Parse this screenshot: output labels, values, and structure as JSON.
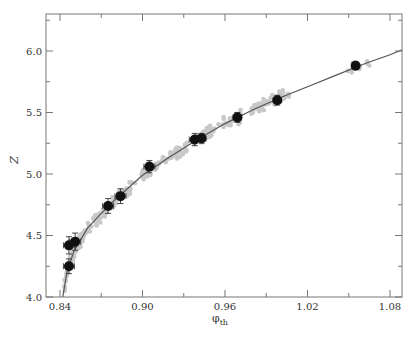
{
  "chart_data": {
    "type": "scatter",
    "title": "",
    "xlabel": "φ",
    "xlabel_sub": "th",
    "ylabel": "Z",
    "xlim": [
      0.83,
      1.09
    ],
    "ylim": [
      4.0,
      6.3
    ],
    "grid": false,
    "legend": null,
    "x_ticks": [
      0.84,
      0.9,
      0.96,
      1.02,
      1.08
    ],
    "x_tick_labels": [
      "0.84",
      "0.90",
      "0.96",
      "1.02",
      "1.08"
    ],
    "x_minor_ticks": [
      0.87,
      0.93,
      0.99,
      1.05
    ],
    "y_ticks": [
      4.0,
      4.5,
      5.0,
      5.5,
      6.0
    ],
    "y_tick_labels": [
      "4.0",
      "4.5",
      "5.0",
      "5.5",
      "6.0"
    ],
    "y_minor_ticks": [
      4.25,
      4.75,
      5.25,
      5.75,
      6.25
    ],
    "series": [
      {
        "name": "mean points with error bars",
        "style": "black filled circles",
        "color": "#111111",
        "x": [
          0.8465,
          0.8465,
          0.851,
          0.875,
          0.884,
          0.905,
          0.938,
          0.943,
          0.969,
          0.998,
          1.055
        ],
        "y": [
          4.25,
          4.42,
          4.45,
          4.74,
          4.82,
          5.06,
          5.28,
          5.29,
          5.46,
          5.6,
          5.88
        ],
        "xerr": [
          0.004,
          0.004,
          0.004,
          0.004,
          0.004,
          0.004,
          0.004,
          0.003,
          0.003,
          0.003,
          0.002
        ],
        "yerr": [
          0.06,
          0.07,
          0.07,
          0.06,
          0.06,
          0.05,
          0.05,
          0.04,
          0.04,
          0.04,
          0.03
        ]
      },
      {
        "name": "fit curve",
        "style": "line",
        "color": "#555555",
        "x": [
          0.842,
          0.845,
          0.85,
          0.86,
          0.87,
          0.88,
          0.9,
          0.92,
          0.94,
          0.96,
          0.98,
          1.0,
          1.02,
          1.04,
          1.06,
          1.08,
          1.089
        ],
        "y": [
          4.0,
          4.2,
          4.37,
          4.56,
          4.68,
          4.79,
          4.99,
          5.14,
          5.28,
          5.41,
          5.52,
          5.62,
          5.71,
          5.8,
          5.89,
          5.97,
          6.01
        ]
      },
      {
        "name": "raw samples",
        "style": "light gray dots",
        "color": "#c8c8c8"
      }
    ]
  }
}
